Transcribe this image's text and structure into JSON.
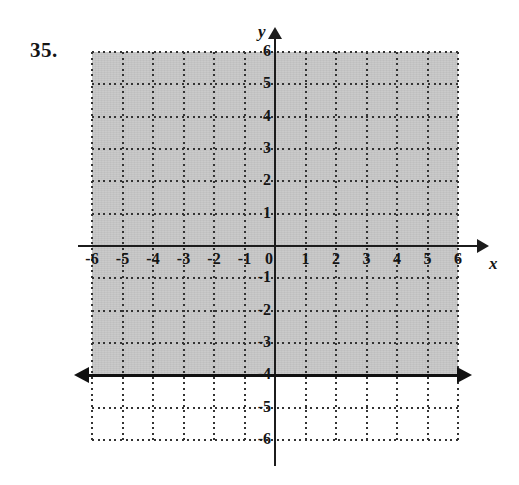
{
  "exercise": {
    "number_label": "35."
  },
  "axis_labels": {
    "y": "y",
    "x": "x"
  },
  "colors": {
    "shading": "#b9b9b9",
    "axis": "#1c1c1c",
    "grid": "#333333",
    "boundary_line": "#111111",
    "background": "#ffffff",
    "text": "#151515"
  },
  "ticks": {
    "x": [
      "-6",
      "-5",
      "-4",
      "-3",
      "-2",
      "-1",
      "0",
      "1",
      "2",
      "3",
      "4",
      "5",
      "6"
    ],
    "y_positive": [
      "6",
      "5",
      "4",
      "3",
      "2",
      "1"
    ],
    "y_negative": [
      "-1",
      "-2",
      "-3",
      "-4",
      "-5",
      "-6"
    ]
  },
  "chart_data": {
    "type": "line",
    "title": "",
    "subtitle": "",
    "xlabel": "x",
    "ylabel": "y",
    "xlim": [
      -6,
      6
    ],
    "ylim": [
      -6,
      6
    ],
    "xticks": [
      -6,
      -5,
      -4,
      -3,
      -2,
      -1,
      0,
      1,
      2,
      3,
      4,
      5,
      6
    ],
    "yticks": [
      -6,
      -5,
      -4,
      -3,
      -2,
      -1,
      0,
      1,
      2,
      3,
      4,
      5,
      6
    ],
    "grid": true,
    "grid_style": "dotted",
    "legend": false,
    "legend_position": "none",
    "series": [
      {
        "name": "boundary",
        "kind": "horizontal-line",
        "equation": "y = -4",
        "y": -4,
        "x_from": -6,
        "x_to": 6,
        "style": "solid",
        "arrows": [
          "left",
          "right"
        ],
        "color": "#111111"
      },
      {
        "name": "solution-region",
        "kind": "shaded-halfplane",
        "inequality": "y >= -4",
        "y_from": -4,
        "y_to": 6,
        "x_from": -6,
        "x_to": 6,
        "fill": "#b9b9b9"
      }
    ],
    "annotations": [
      {
        "text": "35.",
        "role": "exercise-number",
        "x": -7.5,
        "y": 6
      }
    ]
  }
}
